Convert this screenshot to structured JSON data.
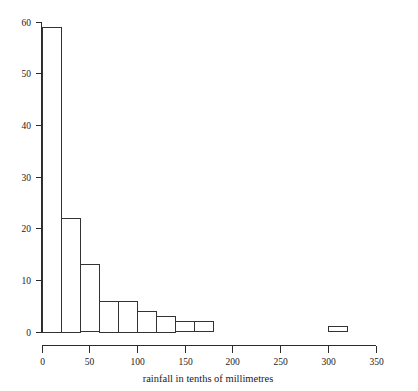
{
  "chart_data": {
    "type": "bar",
    "title": "",
    "subtitle": "",
    "xlabel": "rainfall in tenths of millimetres",
    "ylabel": "",
    "xlim": [
      0,
      350
    ],
    "ylim": [
      0,
      60
    ],
    "grid": false,
    "legend": null,
    "bin_width": 20,
    "xticks": [
      0,
      50,
      100,
      150,
      200,
      250,
      300,
      350
    ],
    "xtick_labels": [
      "0",
      "50",
      "100",
      "150",
      "200",
      "250",
      "300",
      "350"
    ],
    "yticks": [
      0,
      10,
      20,
      30,
      40,
      50,
      60
    ],
    "ytick_labels": [
      "0",
      "10",
      "20",
      "30",
      "40",
      "50",
      "60"
    ],
    "categories": [
      "0-20",
      "20-40",
      "40-60",
      "60-80",
      "80-100",
      "100-120",
      "120-140",
      "140-160",
      "160-180",
      "300-320"
    ],
    "bins": [
      {
        "start": 0,
        "end": 20,
        "value": 59
      },
      {
        "start": 20,
        "end": 40,
        "value": 22
      },
      {
        "start": 40,
        "end": 60,
        "value": 13
      },
      {
        "start": 60,
        "end": 80,
        "value": 6
      },
      {
        "start": 80,
        "end": 100,
        "value": 6
      },
      {
        "start": 100,
        "end": 120,
        "value": 4
      },
      {
        "start": 120,
        "end": 140,
        "value": 3
      },
      {
        "start": 140,
        "end": 160,
        "value": 2
      },
      {
        "start": 160,
        "end": 180,
        "value": 2
      },
      {
        "start": 300,
        "end": 320,
        "value": 1
      }
    ],
    "values": [
      59,
      22,
      13,
      6,
      6,
      4,
      3,
      2,
      2,
      1
    ],
    "colors": {
      "bar_stroke": "#333333",
      "bar_fill": "none",
      "axis": "#2b2b2b",
      "text": "#1a1a1a",
      "background": "#ffffff"
    }
  }
}
